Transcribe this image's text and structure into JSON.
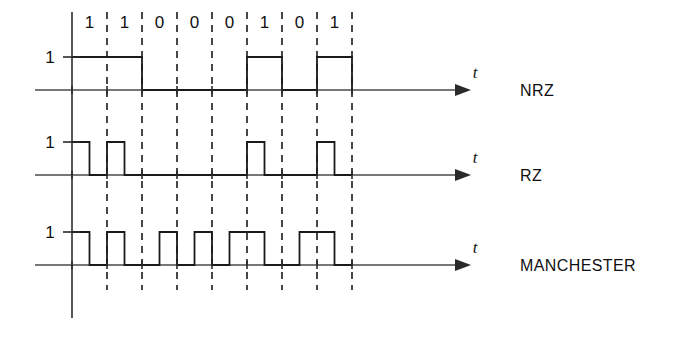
{
  "figure": {
    "bit_sequence": [
      "1",
      "1",
      "0",
      "0",
      "0",
      "1",
      "0",
      "1"
    ],
    "level_label": "1",
    "axis_variable": "t",
    "rows": [
      {
        "name": "NRZ",
        "label": "NRZ"
      },
      {
        "name": "RZ",
        "label": "RZ"
      },
      {
        "name": "MANCHESTER",
        "label": "MANCHESTER"
      }
    ],
    "colors": {
      "ink": "#1a1a1a",
      "axis": "#4a4a4a",
      "background": "#ffffff"
    }
  },
  "chart_data": {
    "type": "line",
    "xlabel": "t",
    "ylabel": "1",
    "categories": [
      "1",
      "1",
      "0",
      "0",
      "0",
      "1",
      "0",
      "1"
    ],
    "grid": true,
    "legend_position": "right",
    "bit_cell_count": 8,
    "series": [
      {
        "name": "NRZ",
        "description": "High for whole bit cell when bit is 1, low when bit is 0",
        "values": [
          1,
          1,
          0,
          0,
          0,
          1,
          0,
          1
        ],
        "half_cells": [
          1,
          1,
          1,
          1,
          0,
          0,
          0,
          0,
          0,
          0,
          1,
          1,
          0,
          0,
          1,
          1
        ]
      },
      {
        "name": "RZ",
        "description": "Pulse in first half of bit cell when bit is 1, low for whole cell when bit is 0",
        "values": [
          1,
          1,
          0,
          0,
          0,
          1,
          0,
          1
        ],
        "half_cells": [
          1,
          0,
          1,
          0,
          0,
          0,
          0,
          0,
          0,
          0,
          1,
          0,
          0,
          0,
          1,
          0
        ]
      },
      {
        "name": "MANCHESTER",
        "description": "Transition in the middle of every bit cell; 1 = high then low, 0 = low then high",
        "values": [
          1,
          1,
          0,
          0,
          0,
          1,
          0,
          1
        ],
        "half_cells": [
          1,
          0,
          1,
          0,
          0,
          1,
          0,
          1,
          0,
          1,
          1,
          0,
          0,
          1,
          1,
          0
        ]
      }
    ]
  }
}
